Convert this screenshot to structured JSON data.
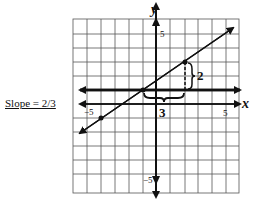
{
  "slope_label": "Slope = 2/3",
  "axes": {
    "x_label": "x",
    "y_label": "y",
    "x_tick_neg": "−5",
    "x_tick_pos": "5",
    "y_tick_pos": "5",
    "y_tick_neg": "−5"
  },
  "annotations": {
    "rise_label": "2",
    "run_label": "3"
  },
  "line": {
    "slope": "2/3",
    "points": [
      [
        -4,
        -2
      ],
      [
        -1,
        0
      ],
      [
        2,
        2
      ]
    ]
  },
  "colors": {
    "ink": "#111111",
    "grid": "#555555",
    "background": "#ffffff"
  }
}
